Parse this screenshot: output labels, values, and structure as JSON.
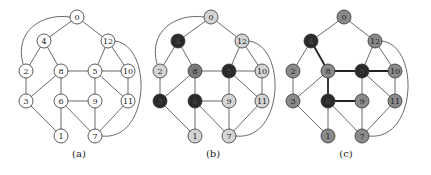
{
  "figure": {
    "panels": [
      {
        "id": "a",
        "caption": "(a)",
        "offset_x": 0,
        "has_arc_0_2": true,
        "node_colors": {
          "default": "#ffffff"
        },
        "bold_edges": []
      },
      {
        "id": "b",
        "caption": "(b)",
        "offset_x": 134,
        "has_arc_0_2": true,
        "node_colors": {
          "default": "#d4d4d4",
          "4": "#2a2a2a",
          "5": "#2a2a2a",
          "3": "#2a2a2a",
          "6": "#2a2a2a",
          "8": "#7a7a7a"
        },
        "bold_edges": []
      },
      {
        "id": "c",
        "caption": "(c)",
        "offset_x": 267,
        "has_arc_0_2": false,
        "node_colors": {
          "default": "#8a8a8a",
          "4": "#2a2a2a",
          "5": "#2a2a2a",
          "6": "#2a2a2a"
        },
        "bold_edges": [
          [
            4,
            8
          ],
          [
            8,
            5
          ],
          [
            8,
            6
          ],
          [
            6,
            9
          ],
          [
            5,
            10
          ]
        ]
      }
    ],
    "nodes": [
      {
        "id": 0,
        "label": "0",
        "x": 77,
        "y": 17
      },
      {
        "id": 4,
        "label": "4",
        "x": 44,
        "y": 41
      },
      {
        "id": 12,
        "label": "12",
        "x": 108,
        "y": 41
      },
      {
        "id": 2,
        "label": "2",
        "x": 26,
        "y": 71
      },
      {
        "id": 8,
        "label": "8",
        "x": 61,
        "y": 71
      },
      {
        "id": 5,
        "label": "5",
        "x": 95,
        "y": 71
      },
      {
        "id": 10,
        "label": "10",
        "x": 128,
        "y": 71
      },
      {
        "id": 3,
        "label": "3",
        "x": 26,
        "y": 101
      },
      {
        "id": 6,
        "label": "6",
        "x": 61,
        "y": 101
      },
      {
        "id": 9,
        "label": "9",
        "x": 95,
        "y": 101
      },
      {
        "id": 11,
        "label": "11",
        "x": 128,
        "y": 101
      },
      {
        "id": 1,
        "label": "1",
        "x": 61,
        "y": 136
      },
      {
        "id": 7,
        "label": "7",
        "x": 95,
        "y": 136
      }
    ],
    "edges": [
      [
        0,
        4
      ],
      [
        0,
        12
      ],
      [
        4,
        2
      ],
      [
        4,
        8
      ],
      [
        12,
        5
      ],
      [
        12,
        10
      ],
      [
        2,
        3
      ],
      [
        8,
        3
      ],
      [
        8,
        5
      ],
      [
        8,
        6
      ],
      [
        5,
        10
      ],
      [
        5,
        9
      ],
      [
        5,
        11
      ],
      [
        10,
        11
      ],
      [
        3,
        1
      ],
      [
        6,
        9
      ],
      [
        6,
        1
      ],
      [
        6,
        7
      ],
      [
        9,
        7
      ],
      [
        11,
        7
      ]
    ],
    "arcs": [
      {
        "from": 0,
        "to": 2,
        "side": "left"
      },
      {
        "from": 12,
        "to": 7,
        "side": "right"
      }
    ],
    "caption_y": 157,
    "node_radius": 7
  }
}
